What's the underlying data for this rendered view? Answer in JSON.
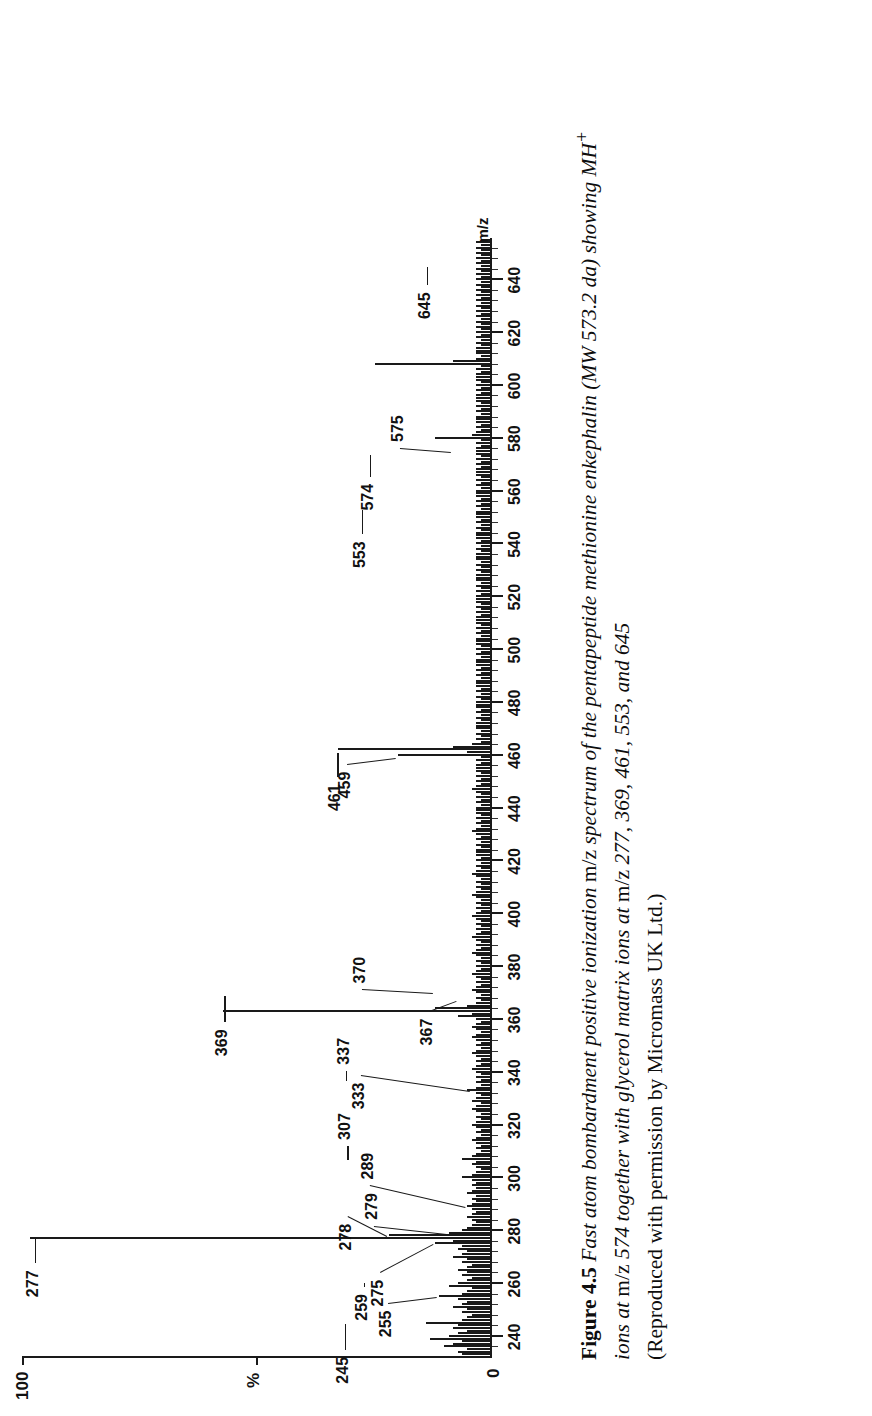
{
  "figure": {
    "number_label": "Figure 4.5",
    "caption_line1_italic_a": "Fast atom bombardment positive ionization ",
    "caption_line1_roman_a": "m/z",
    "caption_line1_italic_b": " spectrum of the pentapeptide methionine enkephalin (MW 573.2 da) showing MH",
    "caption_line1_sup": "+",
    "caption_line2_italic_a": "ions at ",
    "caption_line2_roman_a": "m/z",
    "caption_line2_italic_b": " 574 together with glycerol matrix ions at ",
    "caption_line2_roman_b": "m/z",
    "caption_line2_italic_c": " 277, 369, 461, 553, and 645",
    "caption_line3": "(Reproduced with permission by Micromass UK Ltd.)"
  },
  "axes": {
    "y_top_label": "100",
    "y_zero_label": "0",
    "y_axis_title": "%",
    "x_axis_title": "m/z",
    "x_tick_labels": [
      "240",
      "260",
      "280",
      "300",
      "320",
      "340",
      "360",
      "380",
      "400",
      "420",
      "440",
      "460",
      "480",
      "500",
      "520",
      "540",
      "560",
      "580",
      "600",
      "620",
      "640"
    ],
    "x_min": 232,
    "x_max": 656,
    "y_min": 0,
    "y_max": 100
  },
  "annotations": [
    {
      "label": "245",
      "mz": 245
    },
    {
      "label": "255",
      "mz": 255
    },
    {
      "label": "259",
      "mz": 259
    },
    {
      "label": "275",
      "mz": 275
    },
    {
      "label": "277",
      "mz": 277
    },
    {
      "label": "278",
      "mz": 278
    },
    {
      "label": "279",
      "mz": 279
    },
    {
      "label": "289",
      "mz": 289
    },
    {
      "label": "307",
      "mz": 307
    },
    {
      "label": "333",
      "mz": 333
    },
    {
      "label": "337",
      "mz": 337
    },
    {
      "label": "367",
      "mz": 367
    },
    {
      "label": "369",
      "mz": 369
    },
    {
      "label": "370",
      "mz": 370
    },
    {
      "label": "459",
      "mz": 459
    },
    {
      "label": "461",
      "mz": 461
    },
    {
      "label": "553",
      "mz": 553
    },
    {
      "label": "574",
      "mz": 574
    },
    {
      "label": "575",
      "mz": 575
    },
    {
      "label": "645",
      "mz": 645
    }
  ],
  "chart_data": {
    "type": "bar",
    "xlabel": "m/z",
    "ylabel": "%",
    "xlim": [
      232,
      656
    ],
    "ylim": [
      0,
      100
    ],
    "grid": false,
    "legend": "none",
    "labelled_peaks": {
      "245": 14,
      "255": 11,
      "259": 9,
      "275": 12,
      "277": 100,
      "278": 22,
      "279": 9,
      "289": 5,
      "307": 6,
      "333": 4,
      "337": 5,
      "367": 7,
      "369": 58,
      "370": 12,
      "459": 20,
      "461": 33,
      "553": 12,
      "574": 25,
      "575": 8,
      "645": 10
    },
    "x": [
      233,
      234,
      235,
      236,
      237,
      238,
      239,
      240,
      241,
      242,
      243,
      244,
      245,
      246,
      247,
      248,
      249,
      250,
      251,
      252,
      253,
      254,
      255,
      256,
      257,
      258,
      259,
      260,
      261,
      262,
      263,
      264,
      265,
      266,
      267,
      268,
      269,
      270,
      271,
      272,
      273,
      274,
      275,
      276,
      277,
      278,
      279,
      280,
      281,
      282,
      283,
      284,
      285,
      286,
      287,
      288,
      289,
      290,
      291,
      292,
      293,
      294,
      295,
      296,
      297,
      298,
      299,
      300,
      301,
      302,
      303,
      304,
      305,
      306,
      307,
      308,
      309,
      310,
      311,
      312,
      313,
      314,
      315,
      316,
      317,
      318,
      319,
      320,
      321,
      322,
      323,
      324,
      325,
      326,
      327,
      328,
      329,
      330,
      331,
      332,
      333,
      334,
      335,
      336,
      337,
      338,
      339,
      340,
      341,
      342,
      343,
      344,
      345,
      346,
      347,
      348,
      349,
      350,
      351,
      352,
      353,
      354,
      355,
      356,
      357,
      358,
      359,
      360,
      361,
      362,
      363,
      364,
      365,
      366,
      367,
      368,
      369,
      370,
      371,
      372,
      373,
      374,
      375,
      376,
      377,
      378,
      379,
      380,
      381,
      382,
      383,
      384,
      385,
      386,
      387,
      388,
      389,
      390,
      391,
      392,
      393,
      394,
      395,
      396,
      397,
      398,
      399,
      400,
      401,
      402,
      403,
      404,
      405,
      406,
      407,
      408,
      409,
      410,
      411,
      412,
      413,
      414,
      415,
      416,
      417,
      418,
      419,
      420,
      421,
      422,
      423,
      424,
      425,
      426,
      427,
      428,
      429,
      430,
      431,
      432,
      433,
      434,
      435,
      436,
      437,
      438,
      439,
      440,
      441,
      442,
      443,
      444,
      445,
      446,
      447,
      448,
      449,
      450,
      451,
      452,
      453,
      454,
      455,
      456,
      457,
      458,
      459,
      460,
      461,
      462,
      463,
      464,
      465,
      466,
      467,
      468,
      469,
      470,
      471,
      472,
      473,
      474,
      475,
      476,
      477,
      478,
      479,
      480,
      481,
      482,
      483,
      484,
      485,
      486,
      487,
      488,
      489,
      490,
      491,
      492,
      493,
      494,
      495,
      496,
      497,
      498,
      499,
      500,
      501,
      502,
      503,
      504,
      505,
      506,
      507,
      508,
      509,
      510,
      511,
      512,
      513,
      514,
      515,
      516,
      517,
      518,
      519,
      520,
      521,
      522,
      523,
      524,
      525,
      526,
      527,
      528,
      529,
      530,
      531,
      532,
      533,
      534,
      535,
      536,
      537,
      538,
      539,
      540,
      541,
      542,
      543,
      544,
      545,
      546,
      547,
      548,
      549,
      550,
      551,
      552,
      553,
      554,
      555,
      556,
      557,
      558,
      559,
      560,
      561,
      562,
      563,
      564,
      565,
      566,
      567,
      568,
      569,
      570,
      571,
      572,
      573,
      574,
      575,
      576,
      577,
      578,
      579,
      580,
      581,
      582,
      583,
      584,
      585,
      586,
      587,
      588,
      589,
      590,
      591,
      592,
      593,
      594,
      595,
      596,
      597,
      598,
      599,
      600,
      601,
      602,
      603,
      604,
      605,
      606,
      607,
      608,
      609,
      610,
      611,
      612,
      613,
      614,
      615,
      616,
      617,
      618,
      619,
      620,
      621,
      622,
      623,
      624,
      625,
      626,
      627,
      628,
      629,
      630,
      631,
      632,
      633,
      634,
      635,
      636,
      637,
      638,
      639,
      640,
      641,
      642,
      643,
      644,
      645,
      646,
      647,
      648,
      649,
      650,
      651,
      652,
      653,
      654,
      655
    ],
    "y": [
      6,
      7,
      5,
      10,
      8,
      6,
      13,
      9,
      7,
      5,
      8,
      7,
      14,
      6,
      5,
      4,
      6,
      5,
      8,
      6,
      5,
      7,
      11,
      6,
      5,
      4,
      9,
      7,
      5,
      4,
      6,
      5,
      7,
      5,
      4,
      6,
      5,
      8,
      6,
      5,
      7,
      6,
      12,
      8,
      100,
      22,
      9,
      6,
      5,
      4,
      3,
      4,
      5,
      4,
      3,
      4,
      5,
      4,
      3,
      4,
      3,
      5,
      4,
      3,
      4,
      3,
      4,
      6,
      4,
      3,
      2,
      3,
      4,
      3,
      6,
      4,
      3,
      2,
      3,
      2,
      3,
      4,
      3,
      2,
      3,
      2,
      3,
      4,
      3,
      2,
      3,
      2,
      3,
      4,
      3,
      2,
      4,
      3,
      2,
      3,
      5,
      3,
      2,
      3,
      2,
      3,
      2,
      3,
      4,
      3,
      2,
      3,
      2,
      3,
      4,
      3,
      2,
      3,
      2,
      3,
      4,
      3,
      2,
      3,
      4,
      3,
      2,
      3,
      7,
      4,
      58,
      12,
      5,
      3,
      2,
      3,
      2,
      3,
      4,
      3,
      2,
      3,
      2,
      3,
      4,
      3,
      2,
      3,
      2,
      3,
      2,
      3,
      4,
      3,
      2,
      3,
      2,
      3,
      4,
      3,
      2,
      3,
      2,
      3,
      2,
      3,
      4,
      3,
      2,
      3,
      2,
      3,
      2,
      3,
      4,
      3,
      2,
      3,
      2,
      3,
      2,
      3,
      4,
      3,
      2,
      3,
      2,
      3,
      2,
      3,
      3,
      3,
      2,
      3,
      2,
      3,
      2,
      3,
      4,
      3,
      2,
      3,
      2,
      3,
      2,
      3,
      3,
      3,
      2,
      3,
      2,
      3,
      2,
      3,
      4,
      3,
      2,
      3,
      2,
      3,
      2,
      3,
      3,
      3,
      2,
      3,
      2,
      20,
      5,
      33,
      8,
      4,
      2,
      3,
      2,
      3,
      2,
      3,
      3,
      3,
      2,
      3,
      2,
      3,
      2,
      3,
      3,
      3,
      2,
      3,
      2,
      3,
      2,
      3,
      3,
      3,
      2,
      3,
      2,
      3,
      2,
      3,
      3,
      3,
      2,
      3,
      2,
      3,
      2,
      3,
      3,
      3,
      2,
      3,
      2,
      3,
      2,
      3,
      3,
      3,
      2,
      3,
      2,
      3,
      2,
      3,
      3,
      3,
      2,
      3,
      2,
      3,
      2,
      3,
      3,
      3,
      2,
      3,
      2,
      3,
      2,
      3,
      3,
      3,
      2,
      3,
      2,
      3,
      2,
      3,
      3,
      3,
      2,
      3,
      2,
      3,
      2,
      3,
      3,
      3,
      2,
      3,
      2,
      3,
      2,
      3,
      3,
      3,
      2,
      3,
      2,
      3,
      2,
      3,
      3,
      3,
      2,
      3,
      2,
      3,
      2,
      3,
      3,
      3,
      2,
      3,
      2,
      12,
      4,
      3,
      2,
      3,
      2,
      3,
      3,
      3,
      2,
      3,
      2,
      3,
      2,
      3,
      3,
      3,
      2,
      3,
      2,
      3,
      2,
      3,
      3,
      3,
      2,
      3,
      2,
      25,
      8,
      3,
      2,
      3,
      3,
      3,
      2,
      3,
      2,
      3,
      2,
      3,
      2,
      3,
      2,
      3,
      2,
      3,
      2,
      3,
      2,
      3,
      2,
      3,
      2,
      3,
      2,
      3,
      2,
      3,
      2,
      3,
      2,
      3,
      2,
      3,
      2,
      3,
      2,
      3,
      2,
      3,
      2,
      3,
      2,
      3,
      2,
      3,
      2,
      3,
      2,
      3,
      2,
      3,
      2,
      3,
      2,
      3,
      2,
      3,
      2,
      3,
      2,
      3,
      2,
      3,
      2,
      3,
      2,
      3,
      2,
      3,
      2,
      3,
      2,
      3,
      2,
      3,
      2,
      3,
      2,
      3,
      2,
      3,
      2,
      3,
      2,
      10,
      3,
      2,
      2,
      2,
      2,
      2,
      2,
      2,
      2,
      2
    ]
  }
}
